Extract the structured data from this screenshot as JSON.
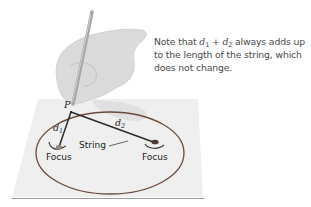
{
  "diagram": {
    "caption": {
      "prefix": "Note that ",
      "var1": "d",
      "var1_sub": "1",
      "operator": " + ",
      "var2": "d",
      "var2_sub": "2",
      "suffix": " always adds up to the length of the string, which does not change."
    },
    "labels": {
      "point": "P",
      "d1": "d",
      "d1_sub": "1",
      "d2": "d",
      "d2_sub": "2",
      "string": "String",
      "focus_left": "Focus",
      "focus_right": "Focus"
    },
    "colors": {
      "paper": "#efefef",
      "paper_edge": "#9a9a9a",
      "ellipse": "#6b4a3a",
      "string": "#2a2a2a",
      "hand": "#d6d6d6",
      "pencil": "#a8a8a8",
      "text": "#4a4a4a"
    }
  }
}
